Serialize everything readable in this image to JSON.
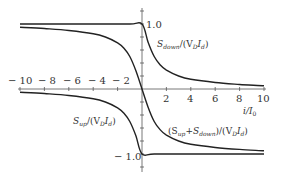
{
  "chart_data": {
    "type": "line",
    "title": "",
    "xlabel": "i/I_0",
    "ylabel": "",
    "xlim": [
      -10,
      10
    ],
    "ylim": [
      -1.0,
      1.0
    ],
    "grid": false,
    "legend": "inline labels",
    "x_ticks": [
      -10,
      -8,
      -6,
      -4,
      -2,
      2,
      4,
      6,
      8,
      10
    ],
    "y_ticks": [
      1.0,
      -1.0
    ],
    "series": [
      {
        "name": "S_down/(V_D I_d)",
        "x": [
          -10,
          -4,
          -1,
          0,
          0.5,
          1,
          1.5,
          2,
          3,
          4,
          6,
          8,
          10
        ],
        "values": [
          1.0,
          1.0,
          1.0,
          1.0,
          0.72,
          0.5,
          0.37,
          0.29,
          0.2,
          0.15,
          0.1,
          0.07,
          0.05
        ]
      },
      {
        "name": "S_up/(V_D I_d)",
        "x": [
          -10,
          -8,
          -6,
          -4,
          -3,
          -2,
          -1.5,
          -1,
          -0.5,
          0,
          1,
          4,
          10
        ],
        "values": [
          -0.05,
          -0.07,
          -0.1,
          -0.15,
          -0.2,
          -0.29,
          -0.37,
          -0.5,
          -0.72,
          -1.0,
          -1.0,
          -1.0,
          -1.0
        ]
      },
      {
        "name": "(S_up+S_down)/(V_D I_d)",
        "x": [
          -10,
          -8,
          -6,
          -4,
          -3,
          -2,
          -1.5,
          -1,
          -0.5,
          0,
          0.5,
          1,
          1.5,
          2,
          3,
          4,
          6,
          8,
          10
        ],
        "values": [
          0.95,
          0.93,
          0.9,
          0.85,
          0.8,
          0.71,
          0.63,
          0.5,
          0.28,
          0.0,
          -0.28,
          -0.5,
          -0.63,
          -0.71,
          -0.8,
          -0.85,
          -0.9,
          -0.93,
          -0.95
        ]
      }
    ],
    "annotations": [
      {
        "text": "S_down/(V_D I_d)",
        "near": "upper right"
      },
      {
        "text": "S_up/(V_D I_d)",
        "near": "lower left"
      },
      {
        "text": "(S_up+S_down)/(V_D I_d)",
        "near": "lower right"
      }
    ]
  },
  "labels": {
    "y_top": "1.0",
    "y_bottom": "− 1.0",
    "x_axis": "i/I",
    "x_axis_sub": "0",
    "ticks_neg": [
      "− 10",
      "− 8",
      "− 6",
      "− 4",
      "− 2"
    ],
    "ticks_pos": [
      "2",
      "4",
      "6",
      "8",
      "10"
    ],
    "sdown": "S",
    "sdown_sub": "down",
    "sdown_rest": "/(V",
    "sdown_D": "D",
    "sdown_I": "I",
    "sdown_d": "d",
    "sdown_close": ")",
    "sup": "S",
    "sup_sub": "up",
    "sum_label": "(S",
    "sum_up": "up",
    "sum_plus": "+S",
    "sum_down": "down",
    "sum_close": ")/(V"
  }
}
